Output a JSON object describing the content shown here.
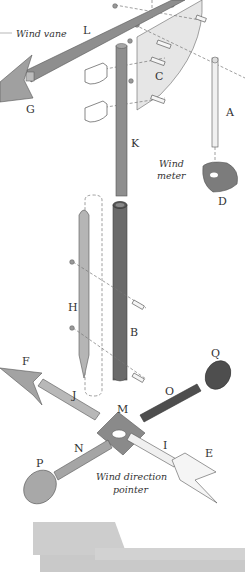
{
  "diagram": {
    "captions": {
      "wind_vane": "Wind vane",
      "wind_meter_line1": "Wind",
      "wind_meter_line2": "meter",
      "wind_direction_line1": "Wind direction",
      "wind_direction_line2": "pointer"
    },
    "parts": {
      "A": "A",
      "B": "B",
      "C": "C",
      "D": "D",
      "E": "E",
      "F": "F",
      "G": "G",
      "H": "H",
      "I": "I",
      "J": "J",
      "K": "K",
      "L": "L",
      "M": "M",
      "N": "N",
      "O": "O",
      "P": "P",
      "Q": "Q"
    },
    "colors": {
      "light_gray": "#b5b5b5",
      "mid_gray": "#8e8e8e",
      "dark_gray": "#5a5a5a",
      "panel": "#e6e6e6",
      "white_part": "#f2f2f2",
      "background": "#ffffff"
    }
  }
}
